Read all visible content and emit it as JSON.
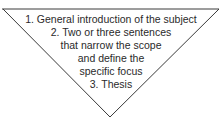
{
  "diagram": {
    "type": "inverted-triangle",
    "stroke_color": "#3a3a3a",
    "lines": [
      "1.  General introduction of the subject",
      "2.  Two or three sentences",
      "that narrow the scope",
      "and define the",
      "specific focus",
      "3.  Thesis"
    ]
  }
}
